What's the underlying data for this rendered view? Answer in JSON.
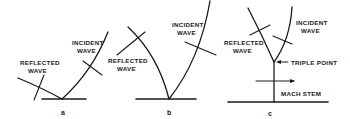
{
  "figure": {
    "panels": [
      {
        "id": "a",
        "label": "a",
        "reflected_label_1": "REFLECTED",
        "reflected_label_2": "WAVE",
        "incident_label_1": "INCIDENT",
        "incident_label_2": "WAVE"
      },
      {
        "id": "b",
        "label": "b",
        "reflected_label_1": "REFLECTED",
        "reflected_label_2": "WAVE",
        "incident_label_1": "INCIDENT",
        "incident_label_2": "WAVE"
      },
      {
        "id": "c",
        "label": "c",
        "reflected_label_1": "REFLECTED",
        "reflected_label_2": "WAVE",
        "incident_label_1": "INCIDENT",
        "incident_label_2": "WAVE",
        "triple_point_label": "TRIPLE POINT",
        "mach_stem_label": "MACH STEM"
      }
    ],
    "colors": {
      "ink": "#1a1a1a",
      "background": "#ffffff"
    }
  }
}
